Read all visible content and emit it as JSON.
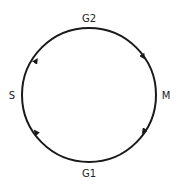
{
  "diagram": {
    "type": "cell-cycle",
    "direction": "clockwise",
    "stroke_color": "#1a1a1a",
    "label_color": "#222222",
    "phases": [
      {
        "id": "g2",
        "label": "G2",
        "position": "top"
      },
      {
        "id": "m",
        "label": "M",
        "position": "right"
      },
      {
        "id": "g1",
        "label": "G1",
        "position": "bottom"
      },
      {
        "id": "s",
        "label": "S",
        "position": "left"
      }
    ],
    "transitions": [
      {
        "from": "G1",
        "to": "S"
      },
      {
        "from": "S",
        "to": "G2"
      },
      {
        "from": "G2",
        "to": "M"
      },
      {
        "from": "M",
        "to": "G1"
      }
    ]
  }
}
